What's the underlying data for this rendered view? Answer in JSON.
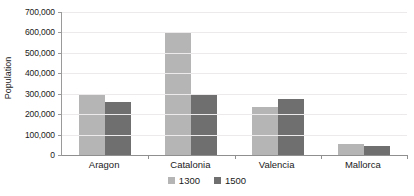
{
  "chart_data": {
    "type": "bar",
    "title": "",
    "subtitle": "",
    "xlabel": "",
    "ylabel": "Population",
    "categories": [
      "Aragon",
      "Catalonia",
      "Valencia",
      "Mallorca"
    ],
    "series": [
      {
        "name": "1300",
        "color": "#b5b5b5",
        "values": [
          300000,
          597000,
          235000,
          54000
        ]
      },
      {
        "name": "1500",
        "color": "#6f6f6f",
        "values": [
          260000,
          298000,
          274000,
          44000
        ]
      }
    ],
    "ylim": [
      0,
      700000
    ],
    "ytick_step": 100000,
    "ytick_labels": [
      "0",
      "100,000",
      "200,000",
      "300,000",
      "400,000",
      "500,000",
      "600,000",
      "700,000"
    ],
    "ytick_values": [
      0,
      100000,
      200000,
      300000,
      400000,
      500000,
      600000,
      700000
    ],
    "grid": true,
    "grid_axis": "y",
    "legend_position": "bottom-center",
    "legend_entries": [
      "1300",
      "1500"
    ],
    "background_color": "#ffffff",
    "axis_color": "#8f8f8f",
    "grid_color": "#eceaea",
    "text_color": "#1a1a1a"
  }
}
